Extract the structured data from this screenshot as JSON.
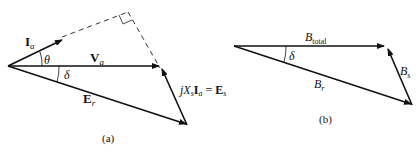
{
  "diagram_a": {
    "caption": "(a)",
    "vectors": {
      "Ia": {
        "main": "I",
        "sub": "a"
      },
      "Va": {
        "main": "V",
        "sub": "a"
      },
      "Er": {
        "main": "E",
        "sub": "r"
      },
      "jXsIa": {
        "j": "j",
        "X": "X",
        "s": "s",
        "I": "I",
        "a": "a",
        "eq": " = ",
        "E": "E",
        "Es_sub": "s"
      }
    },
    "angles": {
      "theta": "θ",
      "delta": "δ"
    }
  },
  "diagram_b": {
    "caption": "(b)",
    "vectors": {
      "Btotal": {
        "main": "B",
        "sub": "total"
      },
      "Bs": {
        "main": "B",
        "sub": "s"
      },
      "Br": {
        "main": "B",
        "sub": "r"
      }
    },
    "angles": {
      "delta": "δ"
    }
  }
}
